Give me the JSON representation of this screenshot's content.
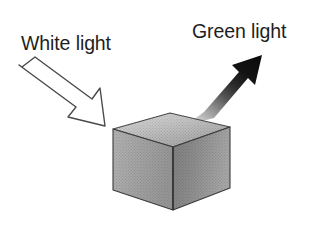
{
  "figure": {
    "background_color": "#ffffff"
  },
  "labels": {
    "incoming": {
      "text": "White light",
      "color": "#1e1e1e"
    },
    "outgoing": {
      "text": "Green light",
      "color": "#1e1e1e"
    }
  },
  "arrows": {
    "incoming": {
      "name": "white-light-arrow",
      "style": "outlined",
      "fill_color": "#ffffff",
      "stroke_color": "#3a3a3a",
      "direction": "down-right"
    },
    "outgoing": {
      "name": "green-light-arrow",
      "style": "filled-gradient",
      "fill_color_tip": "#0d0d0d",
      "fill_color_tail": "#cfcfcf",
      "direction": "up-right"
    }
  },
  "object": {
    "name": "cube",
    "shape": "box",
    "top_face_color": "#b9b9b9",
    "left_face_color": "#9a9a9a",
    "right_face_color": "#8a8a8a",
    "edge_color": "#3c3c3c"
  }
}
